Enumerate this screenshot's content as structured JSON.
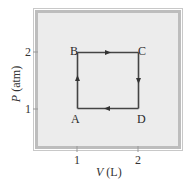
{
  "diagram": {
    "type": "pv-cycle",
    "x_axis": {
      "variable": "V",
      "unit": "(L)",
      "ticks": [
        {
          "value": 1,
          "label": "1"
        },
        {
          "value": 2,
          "label": "2"
        }
      ]
    },
    "y_axis": {
      "variable": "P",
      "unit": "(atm)",
      "ticks": [
        {
          "value": 1,
          "label": "1"
        },
        {
          "value": 2,
          "label": "2"
        }
      ]
    },
    "points": [
      {
        "name": "A",
        "V": 1,
        "P": 1
      },
      {
        "name": "B",
        "V": 1,
        "P": 2
      },
      {
        "name": "C",
        "V": 2,
        "P": 2
      },
      {
        "name": "D",
        "V": 2,
        "P": 1
      }
    ],
    "path": [
      "A",
      "B",
      "C",
      "D",
      "A"
    ],
    "arrows": [
      {
        "segment": "A-B",
        "direction": "up"
      },
      {
        "segment": "B-C",
        "direction": "right"
      },
      {
        "segment": "C-D",
        "direction": "down"
      },
      {
        "segment": "D-A",
        "direction": "left"
      }
    ],
    "colors": {
      "plot_background": "#ececec",
      "frame_band": "#bdbdbd",
      "path_line": "#444444"
    }
  }
}
